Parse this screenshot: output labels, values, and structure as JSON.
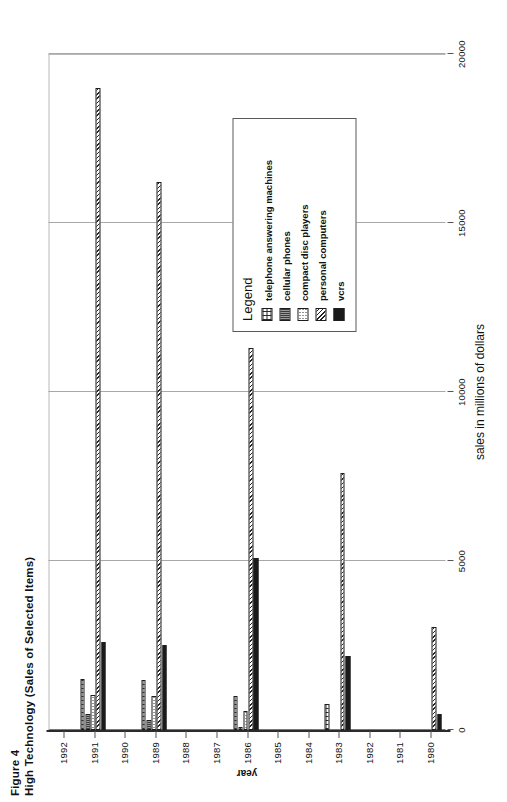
{
  "figure": {
    "number": "Figure 4",
    "title": "High Technology (Sales of Selected Items)"
  },
  "legend": {
    "title": "Legend",
    "entries": [
      {
        "label": "telephone answering machines",
        "pattern": "p-tam"
      },
      {
        "label": "cellular phones",
        "pattern": "p-cell"
      },
      {
        "label": "compact disc players",
        "pattern": "p-cd"
      },
      {
        "label": "personal computers",
        "pattern": "p-pc"
      },
      {
        "label": "vcrs",
        "pattern": "p-vcr"
      }
    ]
  },
  "chart_data": {
    "type": "bar",
    "orientation": "horizontal",
    "title": "High Technology (Sales of Selected Items)",
    "xlabel": "sales in millions of dollars",
    "ylabel": "year",
    "xlim": [
      0,
      20000
    ],
    "xticks": [
      0,
      5000,
      10000,
      15000,
      20000
    ],
    "xtick_labels": [
      "0",
      "5000",
      "10000",
      "15000",
      "20000"
    ],
    "grid": true,
    "legend_position": "right-inside",
    "categories": [
      "1992",
      "1991",
      "1990",
      "1989",
      "1988",
      "1987",
      "1986",
      "1985",
      "1984",
      "1983",
      "1982",
      "1981",
      "1980"
    ],
    "series": [
      {
        "name": "telephone answering machines",
        "values": [
          0,
          1500,
          0,
          1480,
          0,
          0,
          1010,
          0,
          0,
          770,
          0,
          0,
          0
        ]
      },
      {
        "name": "cellular phones",
        "values": [
          0,
          480,
          0,
          300,
          0,
          0,
          90,
          0,
          0,
          0,
          0,
          0,
          0
        ]
      },
      {
        "name": "compact disc players",
        "values": [
          0,
          1050,
          0,
          1000,
          0,
          0,
          560,
          0,
          0,
          0,
          0,
          0,
          0
        ]
      },
      {
        "name": "personal computers",
        "values": [
          0,
          19000,
          0,
          16200,
          0,
          0,
          11300,
          0,
          0,
          7600,
          0,
          0,
          3050
        ]
      },
      {
        "name": "vcrs",
        "values": [
          0,
          2600,
          0,
          2500,
          0,
          0,
          5100,
          0,
          0,
          2200,
          0,
          0,
          480
        ]
      }
    ]
  }
}
